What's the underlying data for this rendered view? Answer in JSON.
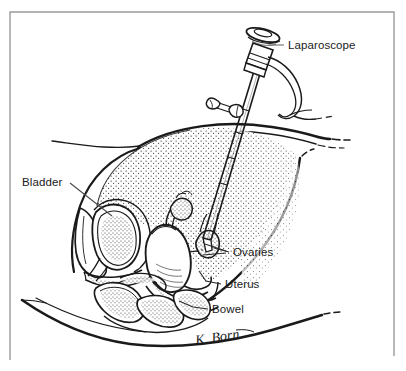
{
  "figure": {
    "background_color": "#ffffff",
    "ink_color": "#1a1a1a",
    "frame_color": "#9a9a9a",
    "signature": "K. Born"
  },
  "labels": [
    {
      "id": "laparoscope",
      "text": "Laparoscope",
      "x": 288,
      "y": 49,
      "anchor": "start",
      "leader": "M 284 45 L 268 45"
    },
    {
      "id": "bladder",
      "text": "Bladder",
      "x": 22,
      "y": 186,
      "anchor": "start",
      "leader": "M 70 183 L 112 216"
    },
    {
      "id": "ovaries",
      "text": "Ovaries",
      "x": 233,
      "y": 256,
      "anchor": "start",
      "leader": "M 229 252 L 214 248 M 229 252 L 205 244 M 229 252 L 203 254"
    },
    {
      "id": "uterus",
      "text": "Uterus",
      "x": 225,
      "y": 288,
      "anchor": "start",
      "leader": "M 221 284 L 206 281 L 200 272"
    },
    {
      "id": "bowel",
      "text": "Bowel",
      "x": 212,
      "y": 313,
      "anchor": "start",
      "leader": "M 208 309 L 192 307 L 178 301"
    }
  ],
  "anatomy": {
    "parts": [
      "abdominal-wall",
      "peritoneal-cavity",
      "bladder",
      "uterus",
      "ovary-left",
      "ovary-right",
      "bowel-loops",
      "rectum",
      "pubic-bone",
      "sacrum",
      "body-contour"
    ]
  },
  "instrument": {
    "name": "Laparoscope",
    "components": [
      "eyepiece",
      "barrel",
      "shaft",
      "light-cable",
      "trocar-port"
    ]
  }
}
